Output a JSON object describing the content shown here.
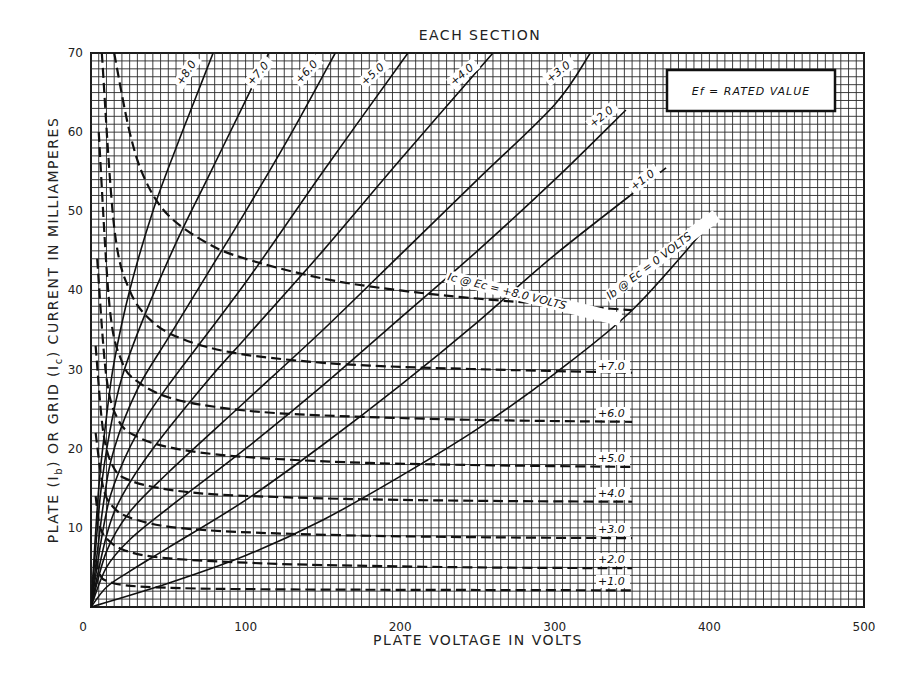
{
  "chart_data": {
    "type": "line",
    "title": "EACH SECTION",
    "xlabel": "PLATE VOLTAGE IN VOLTS",
    "ylabel": "PLATE (Ib) OR GRID (Ic) CURRENT IN MILLIAMPERES",
    "xlim": [
      0,
      500
    ],
    "ylim": [
      0,
      70
    ],
    "x_ticks": [
      0,
      100,
      200,
      300,
      400,
      500
    ],
    "y_ticks": [
      10,
      20,
      30,
      40,
      50,
      60,
      70
    ],
    "grid": true,
    "grid_minor_x": 5,
    "grid_minor_y": 1,
    "legend_box": "Ef = RATED VALUE",
    "annotations": [
      "Ib @ Ec = 0 VOLTS",
      "Ic @ Ec = +8.0 VOLTS"
    ],
    "series": [
      {
        "name": "Ib @ Ec = 0 V",
        "label": "Ib @ Ec = 0 VOLTS",
        "style": "solid",
        "kind": "plate",
        "x": [
          0,
          50,
          100,
          150,
          200,
          250,
          300,
          350,
          396
        ],
        "y": [
          0,
          3,
          6.5,
          11,
          16.5,
          22.5,
          29.5,
          37.5,
          47.5
        ]
      },
      {
        "name": "Ib @ Ec = +1.0 V",
        "label": "+1.0",
        "style": "solid",
        "kind": "plate",
        "x": [
          0,
          10,
          25,
          50,
          100,
          150,
          200,
          250,
          300,
          372
        ],
        "y": [
          0,
          2.5,
          4.5,
          7.5,
          13.5,
          20.5,
          28,
          36,
          44.5,
          55.5
        ]
      },
      {
        "name": "Ib @ Ec = +2.0 V",
        "label": "+2.0",
        "style": "solid",
        "kind": "plate",
        "x": [
          0,
          10,
          25,
          50,
          100,
          150,
          200,
          250,
          300,
          346
        ],
        "y": [
          0,
          5,
          8.5,
          12.5,
          20,
          28,
          36.5,
          45,
          54,
          62.8
        ]
      },
      {
        "name": "Ib @ Ec = +3.0 V",
        "label": "+3.0",
        "style": "solid",
        "kind": "plate",
        "x": [
          0,
          10,
          25,
          50,
          100,
          150,
          200,
          250,
          300,
          323
        ],
        "y": [
          0,
          7,
          12,
          17,
          26,
          35,
          44.5,
          54,
          63.5,
          70
        ]
      },
      {
        "name": "Ib @ Ec = +4.0 V",
        "label": "+4.0",
        "style": "solid",
        "kind": "plate",
        "x": [
          0,
          10,
          20,
          40,
          75,
          100,
          150,
          200,
          260
        ],
        "y": [
          0,
          9,
          14,
          20,
          28.5,
          34,
          45,
          56.5,
          70
        ]
      },
      {
        "name": "Ib @ Ec = +5.0 V",
        "label": "+5.0",
        "style": "solid",
        "kind": "plate",
        "x": [
          0,
          8,
          15,
          30,
          50,
          100,
          150,
          205
        ],
        "y": [
          0,
          10,
          15.5,
          22,
          28,
          41,
          55,
          70
        ]
      },
      {
        "name": "Ib @ Ec = +6.0 V",
        "label": "+6.0",
        "style": "solid",
        "kind": "plate",
        "x": [
          0,
          8,
          15,
          30,
          50,
          75,
          100,
          130,
          158
        ],
        "y": [
          0,
          13,
          20,
          27.5,
          34,
          42,
          50,
          60,
          70
        ]
      },
      {
        "name": "Ib @ Ec = +7.0 V",
        "label": "+7.0",
        "style": "solid",
        "kind": "plate",
        "x": [
          0,
          6,
          12,
          20,
          35,
          55,
          75,
          95,
          115
        ],
        "y": [
          0,
          14,
          22,
          29,
          37,
          46,
          54,
          62,
          70
        ]
      },
      {
        "name": "Ib @ Ec = +8.0 V",
        "label": "+8.0",
        "style": "solid",
        "kind": "plate",
        "x": [
          0,
          5,
          10,
          15,
          25,
          40,
          55,
          68,
          79
        ],
        "y": [
          0,
          15,
          24,
          31,
          40,
          50,
          58,
          64.5,
          70
        ]
      },
      {
        "name": "Ic @ Ec = +1.0 V",
        "label": "+1.0",
        "style": "dashed",
        "kind": "grid",
        "x": [
          3,
          6,
          10,
          20,
          40,
          80,
          150,
          250,
          350
        ],
        "y": [
          6,
          4,
          3.3,
          2.8,
          2.5,
          2.3,
          2.2,
          2.15,
          2.1
        ]
      },
      {
        "name": "Ic @ Ec = +2.0 V",
        "label": "+2.0",
        "style": "dashed",
        "kind": "grid",
        "x": [
          3,
          6,
          12,
          20,
          35,
          60,
          100,
          150,
          250,
          350
        ],
        "y": [
          14,
          10,
          8.3,
          7.3,
          6.5,
          6,
          5.6,
          5.3,
          5.0,
          4.9
        ]
      },
      {
        "name": "Ic @ Ec = +3.0 V",
        "label": "+3.0",
        "style": "dashed",
        "kind": "grid",
        "x": [
          3,
          8,
          15,
          25,
          45,
          75,
          120,
          180,
          260,
          350
        ],
        "y": [
          22,
          15,
          12.5,
          11.3,
          10.3,
          9.7,
          9.3,
          9.0,
          8.8,
          8.7
        ]
      },
      {
        "name": "Ic @ Ec = +4.0 V",
        "label": "+4.0",
        "style": "dashed",
        "kind": "grid",
        "x": [
          3,
          8,
          15,
          25,
          45,
          75,
          120,
          180,
          260,
          350
        ],
        "y": [
          33,
          22,
          17.5,
          16,
          15,
          14.3,
          13.9,
          13.6,
          13.4,
          13.3
        ]
      },
      {
        "name": "Ic @ Ec = +5.0 V",
        "label": "+5.0",
        "style": "dashed",
        "kind": "grid",
        "x": [
          4,
          10,
          18,
          30,
          50,
          80,
          120,
          180,
          260,
          350
        ],
        "y": [
          44,
          29,
          23.5,
          21.5,
          20.2,
          19.3,
          18.7,
          18.2,
          17.9,
          17.7
        ]
      },
      {
        "name": "Ic @ Ec = +6.0 V",
        "label": "+6.0",
        "style": "dashed",
        "kind": "grid",
        "x": [
          5,
          12,
          20,
          30,
          50,
          80,
          120,
          180,
          260,
          350
        ],
        "y": [
          60,
          38,
          31,
          28.5,
          26.5,
          25.3,
          24.5,
          24,
          23.6,
          23.4
        ]
      },
      {
        "name": "Ic @ Ec = +7.0 V",
        "label": "+7.0",
        "style": "dashed",
        "kind": "grid",
        "x": [
          7,
          15,
          25,
          40,
          60,
          90,
          130,
          180,
          260,
          350
        ],
        "y": [
          70,
          48,
          40,
          36,
          33.8,
          32.2,
          31.2,
          30.5,
          30,
          29.6
        ]
      },
      {
        "name": "Ic @ Ec = +8.0 V",
        "label": "Ic @ Ec = +8.0 VOLTS",
        "style": "dashed",
        "kind": "grid",
        "x": [
          15,
          25,
          35,
          50,
          75,
          100,
          150,
          200,
          260,
          350
        ],
        "y": [
          70,
          60,
          54,
          49.5,
          46,
          44,
          41.5,
          40,
          38.8,
          37.5
        ]
      }
    ]
  },
  "labels": {
    "title": "EACH SECTION",
    "xlabel": "PLATE VOLTAGE IN VOLTS",
    "ylabel_prefix": "PLATE (I",
    "legend": "Ef = RATED VALUE",
    "ib_annotation": "Ib @ Ec = 0 VOLTS",
    "ic_annotation": "Ic @ Ec = +8.0 VOLTS"
  },
  "colors": {
    "ink": "#111111",
    "grid": "#2a2a2a",
    "paper": "#ffffff"
  }
}
